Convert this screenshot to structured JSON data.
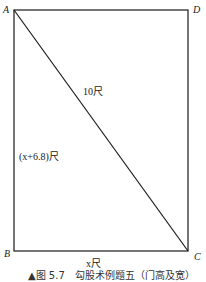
{
  "figure": {
    "vertices": {
      "A": "A",
      "B": "B",
      "C": "C",
      "D": "D"
    },
    "labels": {
      "diagonal": "10尺",
      "height": "(x+6.8)尺",
      "width": "x尺"
    },
    "caption": "▲图 5.7　勾股术例题五（门高及宽）",
    "colors": {
      "line": "#1a1a1a",
      "background": "#ffffff"
    }
  }
}
